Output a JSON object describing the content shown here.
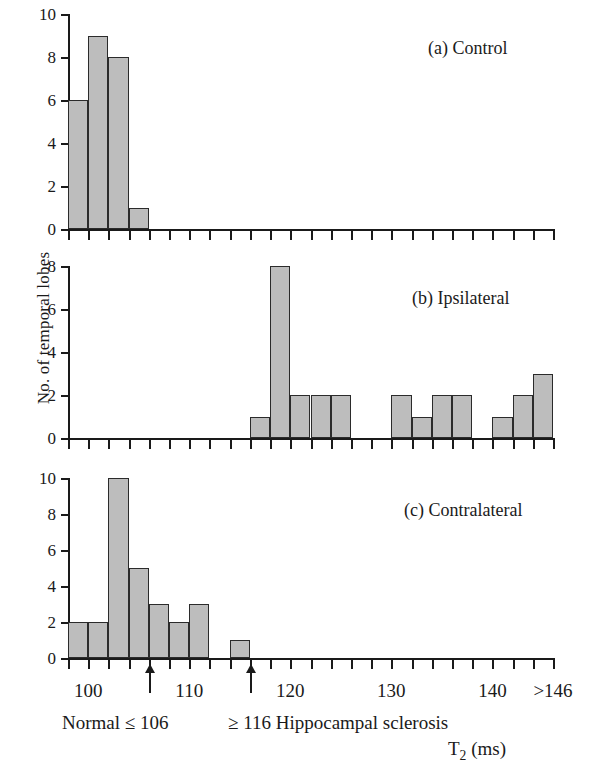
{
  "figure": {
    "ylabel": "No. of temporal lobes",
    "xlabel_main": "T",
    "xlabel_sub": "2",
    "xlabel_unit": " (ms)",
    "bar_fill": "#bdbdbd",
    "bar_edge": "#2b2b2b",
    "axis_color": "#1a1a1a"
  },
  "annotations": {
    "left_note": "Normal ≤ 106",
    "right_note": "≥ 116 Hippocampal sclerosis",
    "arrow1_value": 106,
    "arrow2_value": 116
  },
  "xaxis": {
    "min": 98,
    "max": 146,
    "bin_width": 2,
    "tick_values": [
      98,
      100,
      102,
      104,
      106,
      108,
      110,
      112,
      114,
      116,
      118,
      120,
      122,
      124,
      126,
      128,
      130,
      132,
      134,
      136,
      138,
      140,
      142,
      144,
      146
    ],
    "labeled_ticks": [
      {
        "value": 100,
        "text": "100"
      },
      {
        "value": 110,
        "text": "110"
      },
      {
        "value": 120,
        "text": "120"
      },
      {
        "value": 130,
        "text": "130"
      },
      {
        "value": 140,
        "text": "140"
      },
      {
        "value": 146,
        "text": ">146"
      }
    ]
  },
  "chart_data": [
    {
      "type": "bar",
      "title": "(a) Control",
      "panel": "a",
      "xlabel": "T2 (ms)",
      "ylabel": "No. of temporal lobes",
      "ylim": [
        0,
        10
      ],
      "yticks": [
        0,
        2,
        4,
        6,
        8,
        10
      ],
      "xlim": [
        98,
        146
      ],
      "grid": false,
      "categories": [
        98,
        100,
        102,
        104
      ],
      "values": [
        6,
        9,
        8,
        1
      ]
    },
    {
      "type": "bar",
      "title": "(b) Ipsilateral",
      "panel": "b",
      "xlabel": "T2 (ms)",
      "ylabel": "No. of temporal lobes",
      "ylim": [
        0,
        8
      ],
      "yticks": [
        0,
        2,
        4,
        6,
        8
      ],
      "xlim": [
        98,
        146
      ],
      "grid": false,
      "categories": [
        116,
        118,
        120,
        122,
        124,
        130,
        132,
        134,
        136,
        140,
        142,
        144
      ],
      "values": [
        1,
        8,
        2,
        2,
        2,
        2,
        1,
        2,
        2,
        1,
        2,
        3
      ]
    },
    {
      "type": "bar",
      "title": "(c) Contralateral",
      "panel": "c",
      "xlabel": "T2 (ms)",
      "ylabel": "No. of temporal lobes",
      "ylim": [
        0,
        10
      ],
      "yticks": [
        0,
        2,
        4,
        6,
        8,
        10
      ],
      "xlim": [
        98,
        146
      ],
      "grid": false,
      "categories": [
        98,
        100,
        102,
        104,
        106,
        108,
        110,
        114
      ],
      "values": [
        2,
        2,
        10,
        5,
        3,
        2,
        3,
        1
      ]
    }
  ]
}
